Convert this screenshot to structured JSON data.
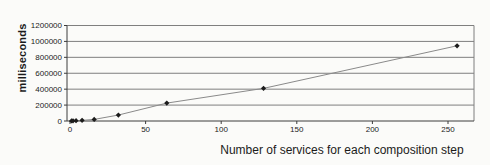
{
  "chart_data": {
    "type": "line",
    "title": "",
    "xlabel": "Number of services for each composition step",
    "ylabel": "milliseconds",
    "x": [
      1,
      2,
      4,
      8,
      16,
      32,
      64,
      128,
      256
    ],
    "y": [
      1000,
      2000,
      4000,
      8000,
      20000,
      75000,
      225000,
      410000,
      945000
    ],
    "x_ticks": [
      0,
      50,
      100,
      150,
      200,
      250
    ],
    "y_ticks": [
      0,
      200000,
      400000,
      600000,
      800000,
      1000000,
      1200000
    ],
    "xlim": [
      0,
      267
    ],
    "ylim": [
      0,
      1200000
    ],
    "grid": "horizontal",
    "legend": "none",
    "marker": "diamond",
    "colors": {
      "line": "#8a8a8a",
      "marker": "#1c1c1c",
      "gridline": "#7f7f7f",
      "axis": "#3c3c3c",
      "text": "#222222",
      "background": "#fbfbf9"
    }
  }
}
